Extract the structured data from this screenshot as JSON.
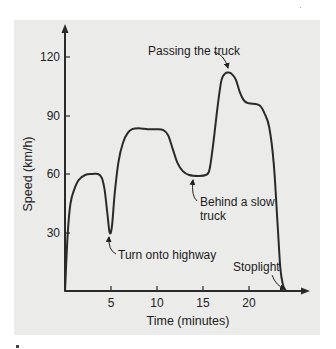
{
  "chart_data": {
    "type": "line",
    "title": "",
    "xlabel": "Time (minutes)",
    "ylabel": "Speed (km/h)",
    "xlim": [
      0,
      26
    ],
    "ylim": [
      0,
      135
    ],
    "x_ticks": [
      5,
      10,
      15,
      20
    ],
    "y_ticks": [
      30,
      60,
      90,
      120
    ],
    "grid": false,
    "legend": null,
    "series": [
      {
        "name": "Speed",
        "x": [
          0,
          0.3,
          0.6,
          1,
          1.5,
          2.2,
          3,
          3.6,
          4.0,
          4.3,
          4.6,
          4.85,
          5.1,
          5.4,
          5.8,
          6.3,
          6.8,
          7.3,
          8,
          9,
          10,
          10.7,
          11.2,
          11.7,
          12.2,
          12.8,
          13.5,
          14.5,
          15.3,
          15.7,
          16.1,
          16.6,
          17.0,
          17.4,
          17.8,
          18.2,
          18.6,
          19.0,
          19.4,
          19.8,
          20.5,
          21.2,
          21.7,
          22.2,
          22.7,
          23.1,
          23.4,
          23.7,
          24.0
        ],
        "values": [
          0,
          30,
          45,
          52,
          57,
          59.5,
          60,
          60,
          58,
          52,
          40,
          30,
          33,
          50,
          66,
          76,
          81,
          83,
          83.5,
          83,
          83,
          82.5,
          80,
          73,
          66,
          61.5,
          59.5,
          59,
          59.5,
          62,
          75,
          95,
          108,
          111.5,
          112,
          111,
          108,
          102,
          98,
          96.5,
          96,
          95,
          91,
          84,
          65,
          35,
          12,
          3,
          0
        ]
      }
    ],
    "annotations": [
      {
        "text": "Passing the truck",
        "x": 18,
        "y": 112
      },
      {
        "text": "Behind a slow truck",
        "x": 14.5,
        "y": 59
      },
      {
        "text": "Turn onto highway",
        "x": 4.85,
        "y": 30
      },
      {
        "text": "Stoplight",
        "x": 24,
        "y": 0
      }
    ]
  },
  "labels": {
    "xlabel": "Time (minutes)",
    "ylabel": "Speed (km/h)",
    "yticks": [
      "30",
      "60",
      "90",
      "120"
    ],
    "xticks": [
      "5",
      "10",
      "15",
      "20"
    ],
    "annot_passing": "Passing the truck",
    "annot_behind_1": "Behind a slow",
    "annot_behind_2": "truck",
    "annot_turn": "Turn onto highway",
    "annot_stoplight": "Stoplight"
  },
  "colors": {
    "panel": "#ebebea",
    "line": "#2a2a2a"
  }
}
